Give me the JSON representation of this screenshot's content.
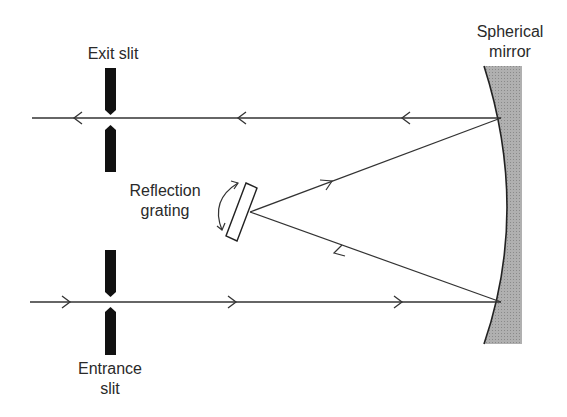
{
  "diagram": {
    "labels": {
      "exit_slit": "Exit slit",
      "mirror_line1": "Spherical",
      "mirror_line2": "mirror",
      "grating_line1": "Reflection",
      "grating_line2": "grating",
      "entrance_line1": "Entrance",
      "entrance_line2": "slit"
    },
    "colors": {
      "line": "#333333",
      "slit": "#111111",
      "mirror_fill": "#aaaaaa"
    }
  }
}
